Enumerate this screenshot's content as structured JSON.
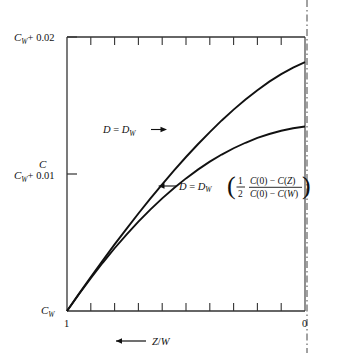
{
  "figure": {
    "name": "concentration-profile-plot",
    "y_axis": {
      "axis_label": "C",
      "ticks": [
        {
          "value": 0.02,
          "label": "C_W + 0.02",
          "base": "C",
          "sub": "W",
          "rest": "+ 0.02"
        },
        {
          "value": 0.01,
          "label": "C_W + 0.01",
          "base": "C",
          "sub": "W",
          "rest": "+ 0.01"
        },
        {
          "value": 0.0,
          "label": "C_W",
          "base": "C",
          "sub": "W",
          "rest": ""
        }
      ]
    },
    "x_axis": {
      "axis_label": "Z/W",
      "direction_arrow": "←",
      "tick_labels": [
        {
          "value": 1,
          "label": "1"
        },
        {
          "value": 0,
          "label": "0"
        }
      ],
      "minor_tick_count": 9
    },
    "annotations": [
      {
        "id": "upper-curve-label",
        "text": "D  =  D_W",
        "lead": "D",
        "eq": "=",
        "base": "D",
        "sub": "W",
        "arrow": "→",
        "arrow_side": "right"
      },
      {
        "id": "lower-curve-label",
        "text": "D  =  D_W",
        "lead": "D",
        "eq": "=",
        "base": "D",
        "sub": "W",
        "arrow": "←",
        "arrow_side": "left",
        "formula": {
          "coefficient_num": "1",
          "coefficient_den": "2",
          "fraction_num": "C(0)  −  C(Z)",
          "fraction_den": "C(0)  −  C(W)",
          "paren_open": "(",
          "paren_close": ")"
        }
      }
    ]
  },
  "chart_data": {
    "type": "line",
    "title": "",
    "xlabel": "Z/W",
    "ylabel": "C",
    "xlim": [
      1,
      0
    ],
    "ylim": [
      0,
      0.02
    ],
    "x_reversed": true,
    "grid": false,
    "legend_position": "inline-annotations",
    "x": [
      1.0,
      0.95,
      0.9,
      0.85,
      0.8,
      0.75,
      0.7,
      0.65,
      0.6,
      0.55,
      0.5,
      0.45,
      0.4,
      0.35,
      0.3,
      0.25,
      0.2,
      0.15,
      0.1,
      0.05,
      0.0
    ],
    "series": [
      {
        "name": "D = D_W",
        "values": [
          0.0,
          0.00125,
          0.00248,
          0.00368,
          0.00486,
          0.006,
          0.00712,
          0.0082,
          0.00925,
          0.01026,
          0.01124,
          0.01217,
          0.01306,
          0.01391,
          0.0147,
          0.01544,
          0.01612,
          0.01674,
          0.01729,
          0.01777,
          0.01816
        ]
      },
      {
        "name": "D = D_W ( 1/2 [C(0)-C(Z)] / [C(0)-C(W)] )",
        "values": [
          0.0,
          0.00122,
          0.0024,
          0.00352,
          0.00458,
          0.00558,
          0.00652,
          0.0074,
          0.00822,
          0.00898,
          0.00968,
          0.01032,
          0.0109,
          0.01142,
          0.01188,
          0.01228,
          0.01263,
          0.01292,
          0.01316,
          0.01334,
          0.01347
        ]
      }
    ]
  }
}
